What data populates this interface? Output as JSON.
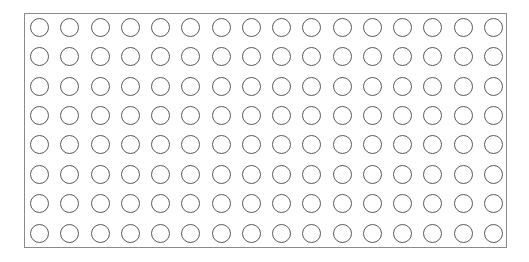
{
  "grid": {
    "rows": 8,
    "columns": 16,
    "cell_shape": "circle",
    "fill": "#ffffff",
    "stroke": "#5a5a5a",
    "border_color": "#8a8a8a"
  }
}
